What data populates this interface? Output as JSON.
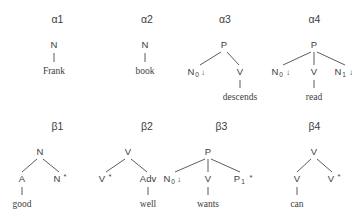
{
  "figure": {
    "background_color": "#ffffff",
    "ink_color": "#3d3d3d",
    "caption": ""
  },
  "trees": [
    {
      "id": "alpha1",
      "title": "α1",
      "root": "N",
      "children": [],
      "anchor": "Frank",
      "anchor_parent": "N"
    },
    {
      "id": "alpha2",
      "title": "α2",
      "root": "N",
      "children": [],
      "anchor": "book",
      "anchor_parent": "N"
    },
    {
      "id": "alpha3",
      "title": "α3",
      "root": "P",
      "children": [
        "N₀↓",
        "V"
      ],
      "anchor": "descends",
      "anchor_parent": "V"
    },
    {
      "id": "alpha4",
      "title": "α4",
      "root": "P",
      "children": [
        "N₀↓",
        "V",
        "N₁↓"
      ],
      "anchor": "read",
      "anchor_parent": "V"
    },
    {
      "id": "beta1",
      "title": "β1",
      "root": "N",
      "children": [
        "A",
        "N*"
      ],
      "anchor": "good",
      "anchor_parent": "A"
    },
    {
      "id": "beta2",
      "title": "β2",
      "root": "V",
      "children": [
        "V*",
        "Adv"
      ],
      "anchor": "well",
      "anchor_parent": "Adv"
    },
    {
      "id": "beta3",
      "title": "β3",
      "root": "P",
      "children": [
        "N₀↓",
        "V",
        "P₁ *"
      ],
      "anchor": "wants",
      "anchor_parent": "V"
    },
    {
      "id": "beta4",
      "title": "β4",
      "root": "V",
      "children": [
        "V",
        "V*"
      ],
      "anchor": "can",
      "anchor_parent": "V"
    }
  ],
  "labels": {
    "N": "N",
    "V": "V",
    "P": "P",
    "A": "A",
    "Adv": "Adv",
    "n_sub0": "N",
    "n_sub1": "N",
    "p_sub1": "P",
    "sub_0": "0",
    "sub_1": "1",
    "down_arrow": "↓",
    "star": "*",
    "v_star": "V",
    "n_star": "N",
    "frank": "Frank",
    "book": "book",
    "descends": "descends",
    "read": "read",
    "good": "good",
    "well": "well",
    "wants": "wants",
    "can": "can"
  }
}
